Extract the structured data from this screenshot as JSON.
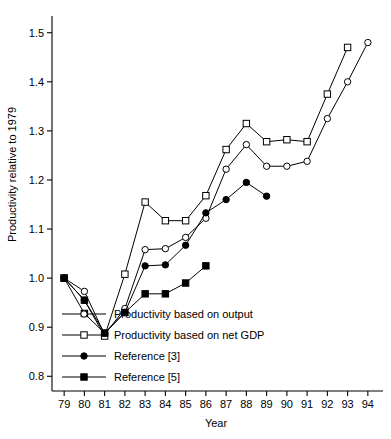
{
  "chart_data": {
    "type": "line",
    "title": "",
    "xlabel": "Year",
    "ylabel": "Productivity relative to 1979",
    "x": [
      79,
      80,
      81,
      82,
      83,
      84,
      85,
      86,
      87,
      88,
      89,
      90,
      91,
      92,
      93,
      94
    ],
    "xtick_labels": [
      "79",
      "80",
      "81",
      "82",
      "83",
      "84",
      "85",
      "86",
      "87",
      "88",
      "89",
      "90",
      "91",
      "92",
      "93",
      "94"
    ],
    "ytick_labels": [
      "0.8",
      "0.9",
      "1.0",
      "1.1",
      "1.2",
      "1.3",
      "1.4",
      "1.5"
    ],
    "ytick_values": [
      0.8,
      0.9,
      1.0,
      1.1,
      1.2,
      1.3,
      1.4,
      1.5
    ],
    "xlim": [
      78.4,
      94.6
    ],
    "ylim": [
      0.77,
      1.53
    ],
    "grid": false,
    "legend_position": "lower-left-inside",
    "series": [
      {
        "name": "Productivity based on output",
        "marker": "open-circle",
        "x": [
          79,
          80,
          81,
          82,
          83,
          84,
          85,
          86,
          87,
          88,
          89,
          90,
          91,
          92,
          93,
          94
        ],
        "values": [
          1.0,
          0.973,
          0.885,
          0.938,
          1.058,
          1.06,
          1.083,
          1.122,
          1.222,
          1.272,
          1.228,
          1.228,
          1.238,
          1.325,
          1.4,
          1.48
        ]
      },
      {
        "name": "Productivity based on net GDP",
        "marker": "open-square",
        "x": [
          79,
          80,
          81,
          82,
          83,
          84,
          85,
          86,
          87,
          88,
          89,
          90,
          91,
          92,
          93,
          94
        ],
        "values": [
          1.0,
          0.955,
          0.882,
          1.008,
          1.155,
          1.117,
          1.117,
          1.168,
          1.262,
          1.315,
          1.278,
          1.282,
          1.278,
          1.375,
          1.47,
          null
        ]
      },
      {
        "name": "Reference [3]",
        "marker": "filled-circle",
        "x": [
          79,
          80,
          81,
          82,
          83,
          84,
          85,
          86,
          87,
          88,
          89
        ],
        "values": [
          1.0,
          0.955,
          0.888,
          0.93,
          1.025,
          1.027,
          1.067,
          1.133,
          1.16,
          1.195,
          1.167
        ]
      },
      {
        "name": "Reference [5]",
        "marker": "filled-square",
        "x": [
          79,
          80,
          81,
          82,
          83,
          84,
          85,
          86
        ],
        "values": [
          1.0,
          0.928,
          0.888,
          0.93,
          0.968,
          0.968,
          0.99,
          1.025
        ]
      }
    ]
  },
  "legend": {
    "items": [
      {
        "label": "Productivity based on output",
        "marker": "open-circle"
      },
      {
        "label": "Productivity based on net GDP",
        "marker": "open-square"
      },
      {
        "label": "Reference [3]",
        "marker": "filled-circle"
      },
      {
        "label": "Reference [5]",
        "marker": "filled-square"
      }
    ]
  }
}
